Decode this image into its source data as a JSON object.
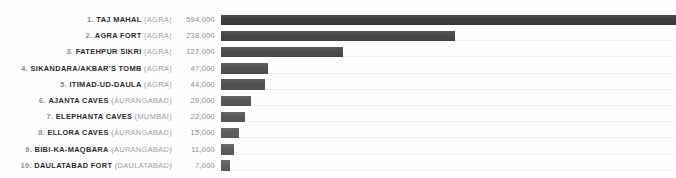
{
  "chart_data": {
    "type": "bar",
    "title": "",
    "subtitle": "",
    "xlabel": "",
    "ylabel": "",
    "orientation": "horizontal",
    "grid": false,
    "legend": "none",
    "xlim": [
      0,
      594000
    ],
    "categories": [
      "TAJ MAHAL",
      "AGRA FORT",
      "FATEHPUR SIKRI",
      "SIKANDARA/AKBAR'S TOMB",
      "ITIMAD-UD-DAULA",
      "AJANTA CAVES",
      "ELEPHANTA CAVES",
      "ELLORA CAVES",
      "BIBI-KA-MAQBARA",
      "DAULATABAD FORT"
    ],
    "values": [
      594000,
      238000,
      127000,
      47000,
      44000,
      29000,
      22000,
      15000,
      11000,
      7000
    ],
    "value_labels": [
      "594,000",
      "238,000",
      "127,000",
      "47,000",
      "44,000",
      "29,000",
      "22,000",
      "15,000",
      "11,000",
      "7,000"
    ],
    "rows": [
      {
        "rank": "1.",
        "site": "TAJ MAHAL",
        "city": "(AGRA)",
        "value": 594000,
        "value_label": "594,000",
        "bar_px": 455,
        "color": "#3b3b3b"
      },
      {
        "rank": "2.",
        "site": "AGRA FORT",
        "city": "(AGRA)",
        "value": 238000,
        "value_label": "238,000",
        "bar_px": 234,
        "color": "#454545"
      },
      {
        "rank": "3.",
        "site": "FATEHPUR SIKRI",
        "city": "(AGRA)",
        "value": 127000,
        "value_label": "127,000",
        "bar_px": 122,
        "color": "#4a4a4a"
      },
      {
        "rank": "4.",
        "site": "SIKANDARA/AKBAR'S TOMB",
        "city": "(AGRA)",
        "value": 47000,
        "value_label": "47,000",
        "bar_px": 47,
        "color": "#4f4f4f"
      },
      {
        "rank": "5.",
        "site": "ITIMAD-UD-DAULA",
        "city": "(AGRA)",
        "value": 44000,
        "value_label": "44,000",
        "bar_px": 44,
        "color": "#4f4f4f"
      },
      {
        "rank": "6.",
        "site": "AJANTA CAVES",
        "city": "(AURANGABAD)",
        "value": 29000,
        "value_label": "29,000",
        "bar_px": 30,
        "color": "#555555"
      },
      {
        "rank": "7.",
        "site": "ELEPHANTA CAVES",
        "city": "(MUMBAI)",
        "value": 22000,
        "value_label": "22,000",
        "bar_px": 24,
        "color": "#585858"
      },
      {
        "rank": "8.",
        "site": "ELLORA CAVES",
        "city": "(AURANGABAD)",
        "value": 15000,
        "value_label": "15,000",
        "bar_px": 18,
        "color": "#5a5a5a"
      },
      {
        "rank": "9.",
        "site": "BIBI-KA-MAQBARA",
        "city": "(AURANGABAD)",
        "value": 11000,
        "value_label": "11,000",
        "bar_px": 13,
        "color": "#5c5c5c"
      },
      {
        "rank": "10.",
        "site": "DAULATABAD FORT",
        "city": "(DAULATABAD)",
        "value": 7000,
        "value_label": "7,000",
        "bar_px": 9,
        "color": "#5e5e5e"
      }
    ]
  },
  "style": {
    "background": "#fefefe",
    "track_color": "#f0f0f0",
    "rank_color": "#8a8a8a",
    "site_color": "#2b2b2b",
    "city_color": "#9b9b9b",
    "value_color": "#8a8a8a"
  }
}
